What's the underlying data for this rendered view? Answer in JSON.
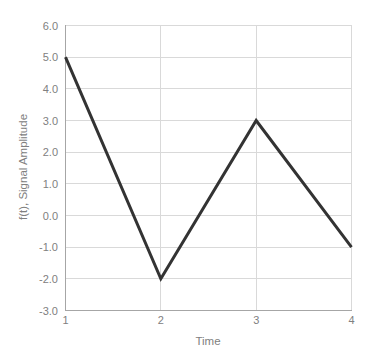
{
  "chart_data": {
    "type": "line",
    "title": "",
    "xlabel": "Time",
    "ylabel": "f(t), Signal Amplitude",
    "x": [
      1,
      2,
      3,
      4
    ],
    "values": [
      5.0,
      -2.0,
      3.0,
      -1.0
    ],
    "series": [
      {
        "name": "f(t)",
        "values": [
          5.0,
          -2.0,
          3.0,
          -1.0
        ],
        "color": "#333333"
      }
    ],
    "xlim": [
      1,
      4
    ],
    "ylim": [
      -3.0,
      6.0
    ],
    "xticks": [
      "1",
      "2",
      "3",
      "4"
    ],
    "yticks": [
      "-3.0",
      "-2.0",
      "-1.0",
      "0.0",
      "1.0",
      "2.0",
      "3.0",
      "4.0",
      "5.0",
      "6.0"
    ],
    "ytick_values": [
      -3.0,
      -2.0,
      -1.0,
      0.0,
      1.0,
      2.0,
      3.0,
      4.0,
      5.0,
      6.0
    ],
    "grid": "horizontal-and-vertical",
    "legend": "none",
    "gridline_color": "#d9d9d9",
    "axis_text_color": "#808080",
    "background_color": "#ffffff"
  },
  "axes": {
    "y_title": "f(t), Signal Amplitude",
    "x_title": "Time",
    "y_labels": [
      "6.0",
      "5.0",
      "4.0",
      "3.0",
      "2.0",
      "1.0",
      "0.0",
      "-1.0",
      "-2.0",
      "-3.0"
    ],
    "x_labels": [
      "1",
      "2",
      "3",
      "4"
    ]
  }
}
